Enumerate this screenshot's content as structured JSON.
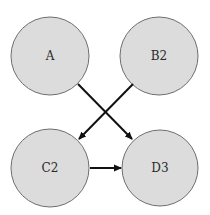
{
  "diagram": {
    "nodes": [
      {
        "id": "A",
        "label": "A",
        "cx": 50,
        "cy": 56,
        "r": 39
      },
      {
        "id": "B2",
        "label": "B2",
        "cx": 159,
        "cy": 56,
        "r": 39
      },
      {
        "id": "C2",
        "label": "C2",
        "cx": 50,
        "cy": 168,
        "r": 39
      },
      {
        "id": "D3",
        "label": "D3",
        "cx": 160,
        "cy": 168,
        "r": 38
      }
    ],
    "edges": [
      {
        "from": "A",
        "to": "D3"
      },
      {
        "from": "B2",
        "to": "C2"
      },
      {
        "from": "C2",
        "to": "D3"
      }
    ],
    "colors": {
      "node_fill": "#dcdcdc",
      "node_stroke": "#6e6e6e",
      "edge": "#111111"
    }
  }
}
